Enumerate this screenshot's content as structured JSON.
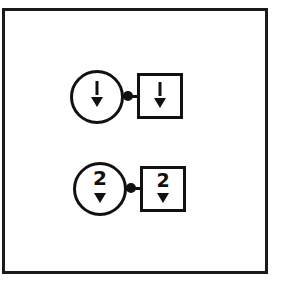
{
  "diagram": {
    "frame": {
      "stroke": "#1a1a1a"
    },
    "rows": [
      {
        "circle_label": "1",
        "square_label": "1",
        "circle_glyph": "down-arrow",
        "square_glyph": "down-arrow"
      },
      {
        "circle_label": "2",
        "square_label": "2",
        "circle_glyph": "down-arrow",
        "square_glyph": "down-arrow"
      }
    ],
    "colors": {
      "ink": "#111111",
      "background": "#ffffff"
    }
  }
}
